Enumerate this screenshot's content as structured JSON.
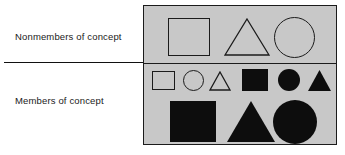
{
  "figure": {
    "type": "concept-classification-diagram",
    "panel_background_color": "#c8c8c8",
    "outline_color": "#1b1b1b",
    "fill_color": "#0d0d0d"
  },
  "labels": {
    "nonmembers": "Nonmembers of concept",
    "members": "Members of concept"
  },
  "regions": [
    {
      "id": "nonmembers",
      "label": "Nonmembers of concept",
      "rows": [
        {
          "id": "nonmembers-row",
          "size": "large",
          "shapes": [
            {
              "shape": "square",
              "fill": "open",
              "size": "large"
            },
            {
              "shape": "triangle",
              "fill": "open",
              "size": "large"
            },
            {
              "shape": "circle",
              "fill": "open",
              "size": "large"
            }
          ]
        }
      ]
    },
    {
      "id": "members",
      "label": "Members of concept",
      "rows": [
        {
          "id": "members-row-small",
          "size": "small",
          "shapes": [
            {
              "shape": "square",
              "fill": "open",
              "size": "small"
            },
            {
              "shape": "circle",
              "fill": "open",
              "size": "small"
            },
            {
              "shape": "triangle",
              "fill": "open",
              "size": "small"
            },
            {
              "shape": "square",
              "fill": "filled",
              "size": "small"
            },
            {
              "shape": "circle",
              "fill": "filled",
              "size": "small"
            },
            {
              "shape": "triangle",
              "fill": "filled",
              "size": "small"
            }
          ]
        },
        {
          "id": "members-row-large",
          "size": "large",
          "shapes": [
            {
              "shape": "square",
              "fill": "filled",
              "size": "large"
            },
            {
              "shape": "triangle",
              "fill": "filled",
              "size": "large"
            },
            {
              "shape": "circle",
              "fill": "filled",
              "size": "large"
            }
          ]
        }
      ]
    }
  ]
}
